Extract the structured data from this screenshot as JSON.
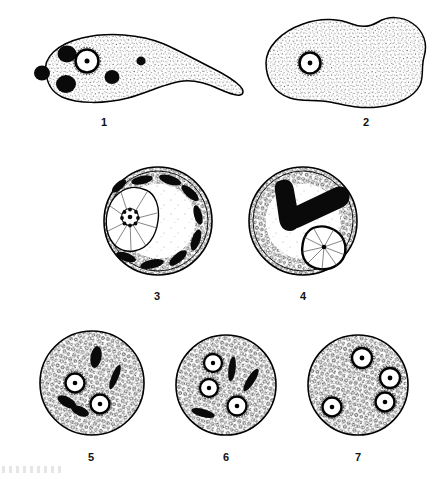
{
  "plate": {
    "title": "Protozoan trophozoite and cyst stages",
    "background_color": "#ffffff",
    "ink_color": "#000000",
    "width": 448,
    "height": 479
  },
  "figures": [
    {
      "label": "1",
      "name": "trophozoite-with-pseudopod",
      "row": 1,
      "shape": "elongate-amoeboid-with-tapering-pseudopod",
      "cytoplasm": "finely-stippled",
      "nuclei": 1,
      "nucleus_style": "ring-with-central-karyosome",
      "inclusions": 5,
      "inclusion_style": "solid-dark-rounded-bodies",
      "chromatoid_bars": 0
    },
    {
      "label": "2",
      "name": "trophozoite-lobed",
      "row": 1,
      "shape": "broad-lobed-amoeboid",
      "cytoplasm": "finely-stippled",
      "nuclei": 1,
      "nucleus_style": "ring-with-central-karyosome",
      "inclusions": 0,
      "chromatoid_bars": 0
    },
    {
      "label": "3",
      "name": "early-cyst-uninucleate-with-chromatoid-ring",
      "row": 2,
      "shape": "round-cyst-with-double-wall",
      "cytoplasm": "coarse-granular-peripheral-band",
      "nuclei": 1,
      "nucleus_style": "large-spoked-with-beaded-karyosome",
      "chromatoid_bars": 9,
      "chromatoid_arrangement": "ring-around-periphery"
    },
    {
      "label": "4",
      "name": "cyst-uninucleate-with-v-shaped-chromatoid-bars",
      "row": 2,
      "shape": "round-cyst-with-double-wall",
      "cytoplasm": "coarse-granular-peripheral-band",
      "nuclei": 1,
      "nucleus_style": "large-spoked-with-central-karyosome",
      "chromatoid_bars": 2,
      "chromatoid_arrangement": "v-shaped-pair-thick-blunt"
    },
    {
      "label": "5",
      "name": "cyst-binucleate",
      "row": 3,
      "shape": "round-cyst",
      "cytoplasm": "coarse-granular",
      "nuclei": 2,
      "nucleus_style": "ring-with-central-karyosome",
      "chromatoid_bars": 4,
      "chromatoid_arrangement": "scattered-rods"
    },
    {
      "label": "6",
      "name": "cyst-trinucleate",
      "row": 3,
      "shape": "round-cyst",
      "cytoplasm": "coarse-granular",
      "nuclei": 3,
      "nucleus_style": "ring-with-central-karyosome",
      "chromatoid_bars": 3,
      "chromatoid_arrangement": "scattered-rods"
    },
    {
      "label": "7",
      "name": "cyst-quadrinucleate-mature",
      "row": 3,
      "shape": "round-cyst",
      "cytoplasm": "coarse-granular",
      "nuclei": 4,
      "nucleus_style": "ring-with-central-karyosome",
      "chromatoid_bars": 0
    }
  ],
  "labels": {
    "fig1": "1",
    "fig2": "2",
    "fig3": "3",
    "fig4": "4",
    "fig5": "5",
    "fig6": "6",
    "fig7": "7"
  }
}
